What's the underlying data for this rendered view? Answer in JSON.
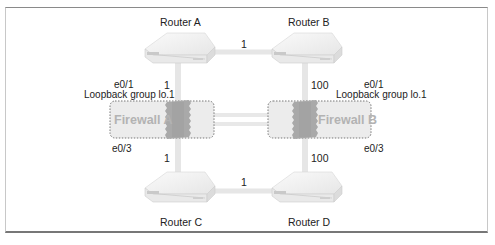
{
  "routers": {
    "a": {
      "label": "Router A"
    },
    "b": {
      "label": "Router B"
    },
    "c": {
      "label": "Router C"
    },
    "d": {
      "label": "Router D"
    }
  },
  "firewalls": {
    "a": {
      "label": "Firewall A",
      "top_interface": "e0/1",
      "loopback": "Loopback group lo.1",
      "bottom_interface": "e0/3"
    },
    "b": {
      "label": "Firewall B",
      "top_interface": "e0/1",
      "loopback": "Loopback group lo.1",
      "bottom_interface": "e0/3"
    }
  },
  "links": {
    "a_b": "1",
    "a_fwa": "1",
    "fwa_c": "1",
    "c_d": "1",
    "b_fwb": "100",
    "fwb_d": "100"
  },
  "colors": {
    "link": "#e6e6e6",
    "firewall_box": "#ececec",
    "firewall_border": "#777777",
    "firewall_wall": "#a9a9a9",
    "firewall_text": "#b3b3b3"
  }
}
